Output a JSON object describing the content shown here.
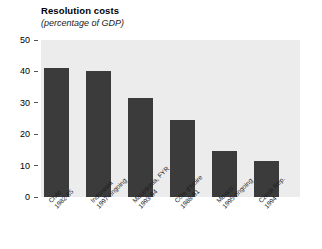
{
  "chart_data": {
    "type": "bar",
    "title": "Resolution costs",
    "subtitle": "(percentage of GDP)",
    "xlabel": "",
    "ylabel": "",
    "ylim": [
      0,
      50
    ],
    "yticks": [
      0,
      10,
      20,
      30,
      40,
      50
    ],
    "grid": false,
    "legend": "none",
    "bar_color": "#3b3b3b",
    "panel_color": "#ececec",
    "categories": [
      "Chile 1982-85",
      "Indonesia 1997-ongoing",
      "Macedonia, FYR 1993-94",
      "Côte d'Ivoire 1988-91",
      "Mexico 1995-ongoing",
      "Czech Rep. 1994"
    ],
    "values": [
      41,
      40,
      31.5,
      24.5,
      14.5,
      11.5
    ],
    "points": [
      {
        "country": "Chile",
        "years": "1982-85",
        "value": 41
      },
      {
        "country": "Indonesia",
        "years": "1997-ongoing",
        "value": 40
      },
      {
        "country": "Macedonia, FYR",
        "years": "1993-94",
        "value": 31.5
      },
      {
        "country": "Côte d'Ivoire",
        "years": "1988-91",
        "value": 24.5
      },
      {
        "country": "Mexico",
        "years": "1995-ongoing",
        "value": 14.5
      },
      {
        "country": "Czech Rep.",
        "years": "1994",
        "value": 11.5
      }
    ]
  },
  "axis": {
    "tick_labels": [
      "50",
      "40",
      "30",
      "20",
      "10",
      "0"
    ]
  }
}
